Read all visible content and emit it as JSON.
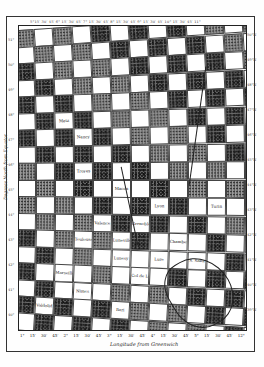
{
  "map": {
    "type": "scanned checkerboard grid map",
    "x_axis_label": "Longitude from Greenwich",
    "y_axis_label": "Degrees North from Equator",
    "top_tick_text": "5°15′ 30′ 45′ 6° 15′ 30′ 45′ 7° 15′ 30′ 45′ 8° 15′ 30′ 45′ 9° 15′ 30′ 45′ 10° 15′ 30′ 45′ 11°",
    "bottom_ticks": [
      "1°",
      "15′",
      "30′",
      "45′",
      "2°",
      "15′",
      "30′",
      "45′",
      "3°",
      "15′",
      "30′",
      "45′",
      "4°",
      "15′",
      "30′",
      "45′",
      "5°",
      "15′",
      "30′",
      "45′",
      "12°"
    ],
    "left_ticks": [
      "51°",
      "50°",
      "49°",
      "48°",
      "47°",
      "46°",
      "45°",
      "44°",
      "43°",
      "42°",
      "41°",
      "40°"
    ],
    "right_ticks": [
      "50°N",
      "49°N",
      "48°N",
      "47°N",
      "46°N",
      "45°N",
      "44°N",
      "43°N",
      "42°N",
      "41°N",
      "40°N",
      "39°N"
    ],
    "place_labels": [
      {
        "row": 5,
        "col": 2,
        "text": "Metz"
      },
      {
        "row": 6,
        "col": 3,
        "text": "Nancy"
      },
      {
        "row": 8,
        "col": 3,
        "text": "Troyes"
      },
      {
        "row": 9,
        "col": 5,
        "text": "Macon"
      },
      {
        "row": 10,
        "col": 7,
        "text": "Lyon"
      },
      {
        "row": 10,
        "col": 10,
        "text": "Turin"
      },
      {
        "row": 11,
        "col": 4,
        "text": "Valence"
      },
      {
        "row": 11,
        "col": 6,
        "text": "Grenoble"
      },
      {
        "row": 12,
        "col": 3,
        "text": "Toulouse"
      },
      {
        "row": 12,
        "col": 5,
        "text": "Luneville"
      },
      {
        "row": 12,
        "col": 8,
        "text": "Chambery"
      },
      {
        "row": 13,
        "col": 5,
        "text": "Lunesy"
      },
      {
        "row": 13,
        "col": 7,
        "text": "Lure"
      },
      {
        "row": 13,
        "col": 9,
        "text": "S. Saba"
      },
      {
        "row": 14,
        "col": 2,
        "text": "Marseille"
      },
      {
        "row": 14,
        "col": 6,
        "text": "Col de Lemans"
      },
      {
        "row": 15,
        "col": 3,
        "text": "Nimes"
      },
      {
        "row": 16,
        "col": 1,
        "text": "Valdolid"
      },
      {
        "row": 16,
        "col": 5,
        "text": "Bari"
      }
    ]
  }
}
